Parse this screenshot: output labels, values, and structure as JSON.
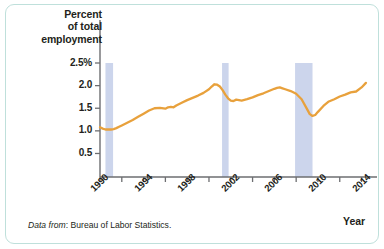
{
  "figure": {
    "card_border_color": "#bfe0db",
    "background_color": "#ffffff"
  },
  "axis": {
    "y_title_line1": "Percent",
    "y_title_line2": "of total",
    "y_title_line3": "employment",
    "x_title": "Year"
  },
  "source": {
    "prefix": "Data from",
    "text": ": Bureau of Labor Statistics."
  },
  "chart_data": {
    "type": "line",
    "title": "",
    "xlabel": "Year",
    "ylabel": "Percent of total employment",
    "xlim": [
      1990,
      2014.5
    ],
    "ylim": [
      0,
      2.62
    ],
    "grid": false,
    "legend": null,
    "line_color": "#e8a13c",
    "recession_band_color": "#ccd5ec",
    "y_ticks": [
      {
        "value": 2.5,
        "label": "2.5%"
      },
      {
        "value": 2.0,
        "label": "2.0"
      },
      {
        "value": 1.5,
        "label": "1.5"
      },
      {
        "value": 1.0,
        "label": "1.0"
      },
      {
        "value": 0.5,
        "label": "0.5"
      }
    ],
    "x_ticks_labeled": [
      {
        "value": 1990,
        "label": "1990"
      },
      {
        "value": 1994,
        "label": "1994"
      },
      {
        "value": 1998,
        "label": "1998"
      },
      {
        "value": 2002,
        "label": "2002"
      },
      {
        "value": 2006,
        "label": "2006"
      },
      {
        "value": 2010,
        "label": "2010"
      },
      {
        "value": 2014,
        "label": "2014"
      }
    ],
    "x_ticks_minor": [
      1992,
      1996,
      2000,
      2004,
      2008,
      2012
    ],
    "recession_bands": [
      {
        "start": 1990.5,
        "end": 1991.2
      },
      {
        "start": 2001.2,
        "end": 2001.8
      },
      {
        "start": 2007.9,
        "end": 2009.5
      }
    ],
    "series": [
      {
        "name": "Temporary help services employment",
        "x": [
          1990.0,
          1990.25,
          1990.5,
          1990.75,
          1991.0,
          1991.25,
          1991.5,
          1991.75,
          1992.0,
          1992.5,
          1993.0,
          1993.5,
          1994.0,
          1994.5,
          1995.0,
          1995.5,
          1996.0,
          1996.25,
          1996.5,
          1996.75,
          1997.0,
          1997.5,
          1998.0,
          1998.5,
          1999.0,
          1999.5,
          2000.0,
          2000.25,
          2000.5,
          2000.75,
          2001.0,
          2001.25,
          2001.5,
          2001.75,
          2002.0,
          2002.25,
          2002.5,
          2002.75,
          2003.0,
          2003.5,
          2004.0,
          2004.5,
          2005.0,
          2005.5,
          2006.0,
          2006.25,
          2006.5,
          2006.75,
          2007.0,
          2007.5,
          2008.0,
          2008.5,
          2009.0,
          2009.25,
          2009.5,
          2009.75,
          2010.0,
          2010.5,
          2011.0,
          2011.5,
          2012.0,
          2012.5,
          2013.0,
          2013.5,
          2014.0,
          2014.4
        ],
        "y": [
          1.08,
          1.05,
          1.03,
          1.03,
          1.03,
          1.04,
          1.06,
          1.09,
          1.12,
          1.18,
          1.24,
          1.31,
          1.38,
          1.45,
          1.5,
          1.51,
          1.49,
          1.52,
          1.53,
          1.52,
          1.56,
          1.62,
          1.68,
          1.73,
          1.78,
          1.84,
          1.92,
          1.98,
          2.03,
          2.02,
          1.98,
          1.9,
          1.8,
          1.72,
          1.67,
          1.66,
          1.69,
          1.68,
          1.67,
          1.7,
          1.74,
          1.79,
          1.83,
          1.88,
          1.93,
          1.95,
          1.96,
          1.94,
          1.92,
          1.88,
          1.82,
          1.7,
          1.48,
          1.37,
          1.33,
          1.35,
          1.42,
          1.55,
          1.65,
          1.7,
          1.76,
          1.8,
          1.85,
          1.87,
          1.96,
          2.06
        ]
      }
    ],
    "annotations": [
      {
        "text": "Shaded bands mark U.S. recessions",
        "shown": false
      }
    ]
  }
}
